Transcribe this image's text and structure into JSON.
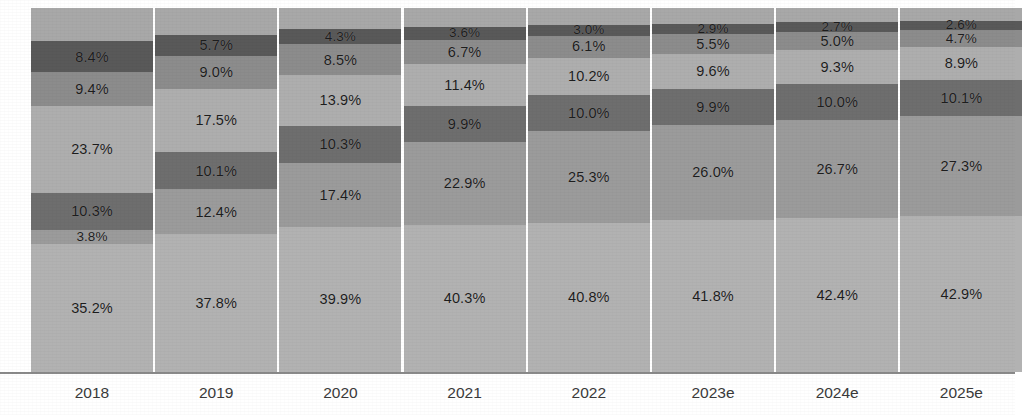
{
  "chart_data": {
    "type": "bar",
    "subtype": "stacked-bar-100-percent",
    "title": "",
    "subtitle": "",
    "xlabel": "",
    "ylabel": "",
    "ylim": [
      0,
      100
    ],
    "grid": false,
    "legend_position": "none",
    "orientation": "vertical",
    "stacked": true,
    "value_suffix": "%",
    "categories": [
      "2018",
      "2019",
      "2020",
      "2021",
      "2022",
      "2023e",
      "2024e",
      "2025e"
    ],
    "series": [
      {
        "name": "Segment 1",
        "color": "#b2b2b2",
        "values": [
          35.2,
          37.8,
          39.9,
          40.3,
          40.8,
          41.8,
          42.4,
          42.9
        ],
        "labels": [
          "35.2%",
          "37.8%",
          "39.9%",
          "40.3%",
          "40.8%",
          "41.8%",
          "42.4%",
          "42.9%"
        ]
      },
      {
        "name": "Segment 2",
        "color": "#9b9b9b",
        "values": [
          3.8,
          12.4,
          17.4,
          22.9,
          25.3,
          26.0,
          26.7,
          27.3
        ],
        "labels": [
          "3.8%",
          "12.4%",
          "17.4%",
          "22.9%",
          "25.3%",
          "26.0%",
          "26.7%",
          "27.3%"
        ]
      },
      {
        "name": "Segment 3",
        "color": "#6e6e6e",
        "values": [
          10.3,
          10.1,
          10.3,
          9.9,
          10.0,
          9.9,
          10.0,
          10.1
        ],
        "labels": [
          "10.3%",
          "10.1%",
          "10.3%",
          "9.9%",
          "10.0%",
          "9.9%",
          "10.0%",
          "10.1%"
        ]
      },
      {
        "name": "Segment 4",
        "color": "#aeaeae",
        "values": [
          23.7,
          17.5,
          13.9,
          11.4,
          10.2,
          9.6,
          9.3,
          8.9
        ],
        "labels": [
          "23.7%",
          "17.5%",
          "13.9%",
          "11.4%",
          "10.2%",
          "9.6%",
          "9.3%",
          "8.9%"
        ]
      },
      {
        "name": "Segment 5",
        "color": "#8c8c8c",
        "values": [
          9.4,
          9.0,
          8.5,
          6.7,
          6.1,
          5.5,
          5.0,
          4.7
        ],
        "labels": [
          "9.4%",
          "9.0%",
          "8.5%",
          "6.7%",
          "6.1%",
          "5.5%",
          "5.0%",
          "4.7%"
        ]
      },
      {
        "name": "Segment 6",
        "color": "#595959",
        "values": [
          8.4,
          5.7,
          4.3,
          3.6,
          3.0,
          2.9,
          2.7,
          2.6
        ],
        "labels": [
          "8.4%",
          "5.7%",
          "4.3%",
          "3.6%",
          "3.0%",
          "2.9%",
          "2.7%",
          "2.6%"
        ]
      },
      {
        "name": "Segment 7",
        "color": "#a8a8a8",
        "values": [
          9.2,
          7.5,
          5.7,
          5.2,
          4.6,
          4.3,
          3.9,
          3.5
        ],
        "labels": [
          "",
          "",
          "",
          "",
          "",
          "",
          "",
          ""
        ]
      }
    ]
  },
  "footnote": {
    "text": ""
  }
}
